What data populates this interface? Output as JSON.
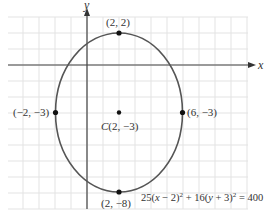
{
  "diagram": {
    "type": "ellipse-on-grid",
    "equation_parts": {
      "a": "25(",
      "x": "x",
      "b": " − 2)",
      "exp1": "2",
      "c": " + 16(",
      "y": "y",
      "d": " + 3)",
      "exp2": "2",
      "e": " = 400"
    },
    "axes": {
      "x_label": "x",
      "y_label": "y"
    },
    "center": {
      "label_prefix": "C",
      "label": "(2, −3)",
      "x": 2,
      "y": -3
    },
    "points": [
      {
        "id": "top",
        "label": "(2, 2)",
        "x": 2,
        "y": 2
      },
      {
        "id": "bottom",
        "label": "(2, −8)",
        "x": 2,
        "y": -8
      },
      {
        "id": "left",
        "label": "(−2, −3)",
        "x": -2,
        "y": -3
      },
      {
        "id": "right",
        "label": "(6, −3)",
        "x": 6,
        "y": -3
      }
    ],
    "semi_axes": {
      "horizontal": 4,
      "vertical": 5
    },
    "colors": {
      "grid": "#e3e3e3",
      "axis": "#444444",
      "curve": "#555555",
      "point": "#111111"
    }
  }
}
